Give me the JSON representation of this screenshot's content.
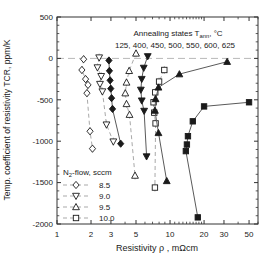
{
  "figure": {
    "annotation": {
      "line1_prefix": "Annealing states T",
      "line1_sub": "ann",
      "line1_suffix": ", °C",
      "line2": "125, 400, 450, 500, 550, 600, 625"
    },
    "legend": {
      "header_prefix": "N",
      "header_sub": "2",
      "header_suffix": "-flow, sccm",
      "items": [
        {
          "label": "8.5",
          "marker": "diamond"
        },
        {
          "label": "9.0",
          "marker": "triangle-down"
        },
        {
          "label": "9.5",
          "marker": "triangle-up"
        },
        {
          "label": "10.0",
          "marker": "square"
        }
      ]
    }
  },
  "colors": {
    "marker": "#1a1a1a",
    "solid_line": "#5a5a5a",
    "dashed_line": "#a9a9a9",
    "zero_line": "#b8b8b8",
    "frame": "#333333",
    "background": "#ffffff"
  },
  "chart_data": {
    "type": "scatter",
    "xlabel": "Resistivity ρ , mΩcm",
    "ylabel": "Temp. coefficient of resistivity TCR, ppm/K",
    "x_scale": "log",
    "xlim": [
      1,
      60
    ],
    "ylim": [
      -2000,
      500
    ],
    "x_ticks_labeled": [
      1,
      2,
      3,
      5,
      10,
      20,
      30,
      50
    ],
    "x_ticks_minor": [
      4,
      6,
      7,
      8,
      9,
      11,
      12,
      13,
      14,
      15,
      16,
      17,
      18,
      19,
      40,
      60
    ],
    "y_ticks_labeled": [
      500,
      0,
      -500,
      -1000,
      -1500,
      -2000
    ],
    "y_minor_step": 100,
    "zero_line": true,
    "annealing_states_c": [
      125,
      400,
      450,
      500,
      550,
      600,
      625
    ],
    "series": [
      {
        "n2_flow": "8.5",
        "marker": "diamond",
        "fill": "open",
        "line": "dashed",
        "points": [
          [
            1.72,
            -10
          ],
          [
            1.66,
            -140
          ],
          [
            1.79,
            -250
          ],
          [
            1.88,
            -320
          ],
          [
            1.84,
            -420
          ],
          [
            1.96,
            -880
          ],
          [
            2.06,
            -1090
          ]
        ]
      },
      {
        "n2_flow": "9.0",
        "marker": "triangle-down",
        "fill": "open",
        "line": "dashed",
        "points": [
          [
            2.36,
            10
          ],
          [
            2.28,
            -110
          ],
          [
            2.46,
            -215
          ],
          [
            2.4,
            -310
          ],
          [
            2.52,
            -400
          ],
          [
            2.74,
            -800
          ],
          [
            3.15,
            -1005
          ]
        ]
      },
      {
        "n2_flow": "8.5",
        "marker": "diamond",
        "fill": "filled",
        "line": "solid",
        "points": [
          [
            2.88,
            -25
          ],
          [
            2.91,
            -150
          ],
          [
            2.95,
            -265
          ],
          [
            2.99,
            -365
          ],
          [
            3.04,
            -480
          ],
          [
            3.1,
            -610
          ],
          [
            3.66,
            -1030
          ]
        ]
      },
      {
        "n2_flow": "9.5",
        "marker": "triangle-up",
        "fill": "open",
        "line": "dashed",
        "points": [
          [
            5.0,
            60
          ],
          [
            4.35,
            -150
          ],
          [
            4.12,
            -290
          ],
          [
            4.02,
            -420
          ],
          [
            4.12,
            -550
          ],
          [
            4.38,
            -680
          ],
          [
            4.9,
            -1415
          ]
        ]
      },
      {
        "n2_flow": "9.0",
        "marker": "triangle-down",
        "fill": "filled",
        "line": "solid",
        "points": [
          [
            6.35,
            25
          ],
          [
            5.85,
            -115
          ],
          [
            5.62,
            -250
          ],
          [
            5.52,
            -380
          ],
          [
            5.62,
            -510
          ],
          [
            5.9,
            -635
          ],
          [
            6.2,
            -1185
          ]
        ]
      },
      {
        "n2_flow": "10.0",
        "marker": "square",
        "fill": "open",
        "line": "dashed",
        "points": [
          [
            8.9,
            -140
          ],
          [
            8.0,
            -280
          ],
          [
            7.4,
            -410
          ],
          [
            7.15,
            -530
          ],
          [
            7.25,
            -655
          ],
          [
            7.45,
            -785
          ],
          [
            7.35,
            -1560
          ]
        ]
      },
      {
        "n2_flow": "9.5",
        "marker": "triangle-up",
        "fill": "filled",
        "line": "solid",
        "points": [
          [
            32,
            -40
          ],
          [
            12.1,
            -190
          ],
          [
            7.9,
            -350
          ],
          [
            7.45,
            -490
          ],
          [
            7.35,
            -630
          ],
          [
            7.9,
            -900
          ],
          [
            9.35,
            -1480
          ]
        ]
      },
      {
        "n2_flow": "10.0",
        "marker": "square",
        "fill": "filled",
        "line": "solid",
        "points": [
          [
            50,
            -530
          ],
          [
            20,
            -580
          ],
          [
            15.9,
            -760
          ],
          [
            14.4,
            -940
          ],
          [
            14.1,
            -1040
          ],
          [
            13.8,
            -1120
          ],
          [
            17.6,
            -1920
          ]
        ]
      }
    ]
  }
}
